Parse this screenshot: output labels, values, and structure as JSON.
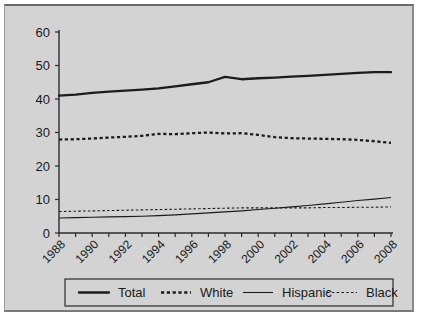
{
  "chart_data": {
    "type": "line",
    "title": "",
    "subtitle": "",
    "xlabel": "",
    "ylabel": "",
    "xlim": [
      1988,
      2008
    ],
    "ylim": [
      0,
      60
    ],
    "grid": false,
    "legend_position": "bottom",
    "x": [
      1988,
      1989,
      1990,
      1991,
      1992,
      1993,
      1994,
      1995,
      1996,
      1997,
      1998,
      1999,
      2000,
      2001,
      2002,
      2003,
      2004,
      2005,
      2006,
      2007,
      2008
    ],
    "x_tick_labels": [
      "1988",
      "1990",
      "1992",
      "1994",
      "1996",
      "1998",
      "2000",
      "2002",
      "2004",
      "2006",
      "2008"
    ],
    "y_tick_labels": [
      "0",
      "10",
      "20",
      "30",
      "40",
      "50",
      "60"
    ],
    "y_ticks": [
      0,
      10,
      20,
      30,
      40,
      50,
      60
    ],
    "series": [
      {
        "name": "Total",
        "style": "solid-thick",
        "values": [
          41.0,
          41.3,
          41.8,
          42.2,
          42.5,
          42.8,
          43.2,
          43.8,
          44.4,
          45.0,
          46.6,
          45.9,
          46.2,
          46.4,
          46.7,
          46.9,
          47.2,
          47.5,
          47.8,
          48.0,
          48.0
        ]
      },
      {
        "name": "White",
        "style": "dashed-thick",
        "values": [
          27.9,
          28.0,
          28.2,
          28.5,
          28.7,
          29.0,
          29.6,
          29.5,
          29.8,
          30.0,
          29.7,
          29.8,
          29.3,
          28.6,
          28.3,
          28.2,
          28.1,
          28.0,
          27.8,
          27.4,
          26.9
        ]
      },
      {
        "name": "Hispanic",
        "style": "solid-thin",
        "values": [
          4.5,
          4.6,
          4.7,
          4.8,
          4.9,
          5.0,
          5.2,
          5.4,
          5.7,
          6.0,
          6.3,
          6.6,
          7.0,
          7.4,
          7.8,
          8.2,
          8.7,
          9.2,
          9.7,
          10.1,
          10.6
        ]
      },
      {
        "name": "Black",
        "style": "dashed-thin",
        "values": [
          6.4,
          6.5,
          6.6,
          6.7,
          6.8,
          6.9,
          7.0,
          7.1,
          7.2,
          7.3,
          7.4,
          7.5,
          7.5,
          7.5,
          7.5,
          7.5,
          7.6,
          7.6,
          7.7,
          7.7,
          7.8
        ]
      }
    ],
    "legend": [
      {
        "label": "Total",
        "style": "solid-thick"
      },
      {
        "label": "White",
        "style": "dashed-thick"
      },
      {
        "label": "Hispanic",
        "style": "solid-thin"
      },
      {
        "label": "Black",
        "style": "dashed-thin"
      }
    ]
  }
}
